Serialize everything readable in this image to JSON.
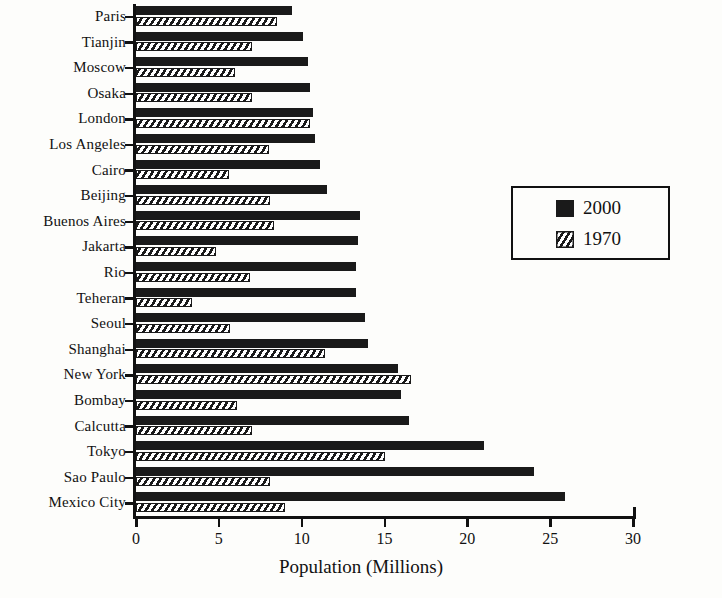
{
  "chart_data": {
    "type": "bar",
    "orientation": "horizontal",
    "title": "",
    "xlabel": "Population (Millions)",
    "ylabel": "",
    "xlim": [
      0,
      30
    ],
    "xticks": [
      0,
      5,
      10,
      15,
      20,
      25,
      30
    ],
    "grid": false,
    "legend_position": "center-right",
    "categories": [
      "Paris",
      "Tianjin",
      "Moscow",
      "Osaka",
      "London",
      "Los Angeles",
      "Cairo",
      "Beijing",
      "Buenos Aires",
      "Jakarta",
      "Rio",
      "Teheran",
      "Seoul",
      "Shanghai",
      "New York",
      "Bombay",
      "Calcutta",
      "Tokyo",
      "Sao Paulo",
      "Mexico City"
    ],
    "series": [
      {
        "name": "2000",
        "color": "#1a1a1a",
        "pattern": "solid",
        "values": [
          9.4,
          10.1,
          10.4,
          10.5,
          10.7,
          10.8,
          11.1,
          11.5,
          13.5,
          13.4,
          13.3,
          13.3,
          13.8,
          14.0,
          15.8,
          16.0,
          16.5,
          21.0,
          24.0,
          25.9
        ]
      },
      {
        "name": "1970",
        "color": "#1a1a1a",
        "pattern": "diagonal-hatch",
        "values": [
          8.5,
          7.0,
          6.0,
          7.0,
          10.5,
          8.0,
          5.6,
          8.1,
          8.3,
          4.8,
          6.9,
          3.4,
          5.7,
          11.4,
          16.6,
          6.1,
          7.0,
          15.0,
          8.1,
          9.0
        ]
      }
    ]
  },
  "legend": {
    "entries": [
      {
        "label": "2000",
        "swatch": "solid-black-swatch"
      },
      {
        "label": "1970",
        "swatch": "hatched-swatch"
      }
    ]
  },
  "axis": {
    "x_title": "Population (Millions)",
    "tick_labels": [
      "0",
      "5",
      "10",
      "15",
      "20",
      "25",
      "30"
    ]
  }
}
